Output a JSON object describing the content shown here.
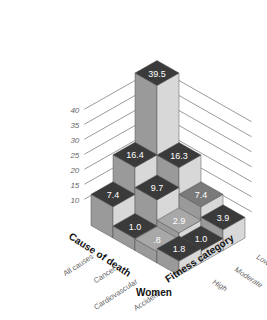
{
  "chart_data": {
    "type": "bar3d",
    "title": "Women",
    "xlabel": "Cause of death",
    "ylabel": "Fitness category",
    "zlabel": "",
    "x_categories": [
      "All causes",
      "Cancer",
      "Cardiovascular",
      "Accident"
    ],
    "y_categories": [
      "Low",
      "Moderate",
      "High"
    ],
    "z_ticks": [
      10,
      15,
      20,
      25,
      30,
      35,
      40
    ],
    "zlim": [
      0,
      42
    ],
    "series": [
      {
        "name": "Low",
        "values": [
          39.5,
          16.3,
          7.4,
          3.9
        ]
      },
      {
        "name": "Moderate",
        "values": [
          16.4,
          9.7,
          2.9,
          1.0
        ]
      },
      {
        "name": "High",
        "values": [
          7.4,
          1.0,
          0.8,
          1.8
        ]
      }
    ],
    "value_labels": [
      [
        "39.5",
        "16.3",
        "7.4",
        "3.9"
      ],
      [
        "16.4",
        "9.7",
        "2.9",
        "1.0"
      ],
      [
        "7.4",
        "1.0",
        ".8",
        "1.8"
      ]
    ],
    "grid": true
  },
  "labels": {
    "title": "Women",
    "cause_axis": "Cause of death",
    "fitness_axis": "Fitness category"
  },
  "colors": {
    "top_dark": "#3a3a3a",
    "top_mid": "#7a7a7a",
    "top_light": "#a8a8a8",
    "side_left": "#9a9a9a",
    "side_right": "#d8d8d8",
    "grid": "#555555",
    "tick_text": "#666666"
  }
}
